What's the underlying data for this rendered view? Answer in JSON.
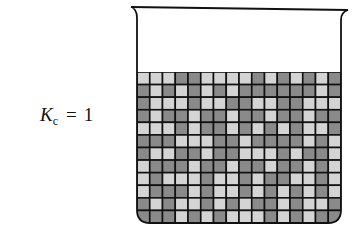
{
  "label": {
    "symbol": "K",
    "subscript": "c",
    "equals": "=",
    "value": "1"
  },
  "beaker": {
    "columns": 16,
    "rows": 12,
    "colors": {
      "light": "#d4d4d4",
      "dark": "#8a8a8a",
      "line": "#111111"
    },
    "grid": [
      "LLLDDLLLLDLDLDLD",
      "DLDLDLDLDDDDDDLD",
      "DLLLDLLDDLLDDLLL",
      "DLDDLDDLDDLDDLDD",
      "LLLDLDDLDLDLDLLD",
      "DDDLLLDDLDDDDLDL",
      "DLLDDLDDLLLDLDDL",
      "LDDDLDDLDDLDDLDL",
      "LDLLLDLLDLDDLLDL",
      "LDDDLDLLDLDLDLDL",
      "DLDLLDLDLDDLDLLD",
      "DDDLDLDLLLDLDLDD"
    ]
  }
}
